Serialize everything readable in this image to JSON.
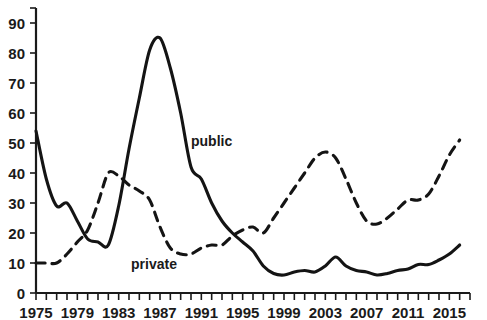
{
  "chart_data": {
    "type": "line",
    "title": "",
    "subtitle": "",
    "xlabel": "",
    "ylabel": "",
    "xlim": [
      1975,
      2017
    ],
    "ylim": [
      0,
      95
    ],
    "y_ticks": [
      0,
      10,
      20,
      30,
      40,
      50,
      60,
      70,
      80,
      90
    ],
    "y_tick_labels": [
      "0",
      "10",
      "20",
      "30",
      "40",
      "50",
      "60",
      "70",
      "80",
      "90"
    ],
    "x_ticks_minor_step": 1,
    "x_tick_labels": [
      "1975",
      "1979",
      "1983",
      "1987",
      "1991",
      "1995",
      "1999",
      "2003",
      "2007",
      "2011",
      "2015"
    ],
    "x_tick_label_values": [
      1975,
      1979,
      1983,
      1987,
      1991,
      1995,
      1999,
      2003,
      2007,
      2011,
      2015
    ],
    "grid": false,
    "legend_position": "inline-annotation",
    "x": [
      1975,
      1976,
      1977,
      1978,
      1979,
      1980,
      1981,
      1982,
      1983,
      1984,
      1985,
      1986,
      1987,
      1988,
      1989,
      1990,
      1991,
      1992,
      1993,
      1994,
      1995,
      1996,
      1997,
      1998,
      1999,
      2000,
      2001,
      2002,
      2003,
      2004,
      2005,
      2006,
      2007,
      2008,
      2009,
      2010,
      2011,
      2012,
      2013,
      2014,
      2015,
      2016
    ],
    "series": [
      {
        "name": "public",
        "style": "solid",
        "color": "#141414",
        "label_x": 1990,
        "label_y": 49,
        "values": [
          54,
          38,
          29,
          30,
          24,
          18,
          17,
          16,
          29,
          48,
          65,
          81,
          85,
          75,
          60,
          42,
          38,
          30,
          24,
          20,
          17,
          14,
          9,
          6.5,
          6,
          7,
          7.5,
          7,
          9,
          12,
          9,
          7.5,
          7,
          6,
          6.5,
          7.5,
          8,
          9.5,
          9.5,
          11,
          13,
          16
        ]
      },
      {
        "name": "private",
        "style": "dashed",
        "color": "#141414",
        "label_x": 1984.2,
        "label_y": 8,
        "values": [
          10,
          10,
          10,
          13,
          17,
          21,
          30,
          40,
          39,
          36,
          34,
          31,
          22,
          15,
          13,
          13,
          15,
          16,
          16,
          19,
          21,
          22,
          20,
          25,
          30,
          35,
          40,
          45,
          47,
          45,
          38,
          30,
          24,
          23,
          25,
          28,
          31,
          31,
          33,
          39,
          46,
          51
        ]
      }
    ]
  },
  "annotations": {
    "public_label": "public",
    "private_label": "private"
  }
}
